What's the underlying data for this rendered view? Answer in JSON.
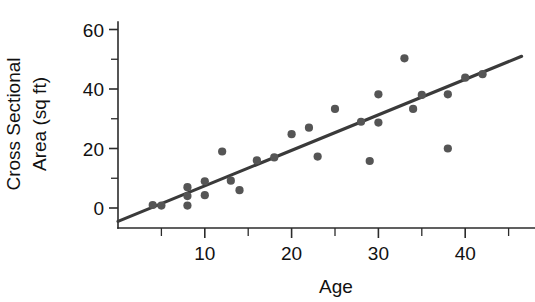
{
  "chart_data": {
    "type": "scatter",
    "title": "",
    "subtitle": "",
    "xlabel": "Age",
    "ylabel": "Cross Sectional Area (sq ft)",
    "ylabel_lines": [
      "Cross Sectional",
      "Area (sq ft)"
    ],
    "xlim": [
      0,
      48
    ],
    "ylim": [
      -8,
      65
    ],
    "x_ticks_major": [
      10,
      20,
      30,
      40
    ],
    "x_tick_labels": [
      "10",
      "20",
      "30",
      "40"
    ],
    "x_ticks_minor": [
      5,
      15,
      25,
      35,
      45
    ],
    "y_ticks_major": [
      0,
      20,
      40,
      60
    ],
    "y_tick_labels": [
      "0",
      "20",
      "40",
      "60"
    ],
    "y_ticks_minor": [
      10,
      30,
      50
    ],
    "grid": false,
    "legend": null,
    "marker_color": "#555555",
    "line_color": "#3a3a3a",
    "axis_color": "#2b2b2b",
    "series": [
      {
        "name": "Trees",
        "type": "scatter",
        "points": [
          {
            "x": 4.0,
            "y": 1.0
          },
          {
            "x": 5.0,
            "y": 0.8
          },
          {
            "x": 8.0,
            "y": 7.0
          },
          {
            "x": 8.0,
            "y": 4.0
          },
          {
            "x": 8.0,
            "y": 0.8
          },
          {
            "x": 10.0,
            "y": 9.0
          },
          {
            "x": 10.0,
            "y": 4.3
          },
          {
            "x": 12.0,
            "y": 19.0
          },
          {
            "x": 13.0,
            "y": 9.2
          },
          {
            "x": 14.0,
            "y": 6.0
          },
          {
            "x": 16.0,
            "y": 16.0
          },
          {
            "x": 18.0,
            "y": 17.0
          },
          {
            "x": 20.0,
            "y": 24.8
          },
          {
            "x": 22.0,
            "y": 27.0
          },
          {
            "x": 23.0,
            "y": 17.3
          },
          {
            "x": 25.0,
            "y": 33.3
          },
          {
            "x": 28.0,
            "y": 29.0
          },
          {
            "x": 29.0,
            "y": 15.8
          },
          {
            "x": 30.0,
            "y": 38.2
          },
          {
            "x": 30.0,
            "y": 28.7
          },
          {
            "x": 33.0,
            "y": 50.3
          },
          {
            "x": 34.0,
            "y": 33.3
          },
          {
            "x": 35.0,
            "y": 38.0
          },
          {
            "x": 38.0,
            "y": 38.2
          },
          {
            "x": 38.0,
            "y": 20.0
          },
          {
            "x": 40.0,
            "y": 43.8
          },
          {
            "x": 42.0,
            "y": 45.0
          }
        ]
      },
      {
        "name": "Regression line",
        "type": "line",
        "endpoints": [
          {
            "x": 0.0,
            "y": -4.5
          },
          {
            "x": 46.5,
            "y": 51.0
          }
        ],
        "slope": 1.194,
        "intercept": -4.5
      }
    ]
  }
}
